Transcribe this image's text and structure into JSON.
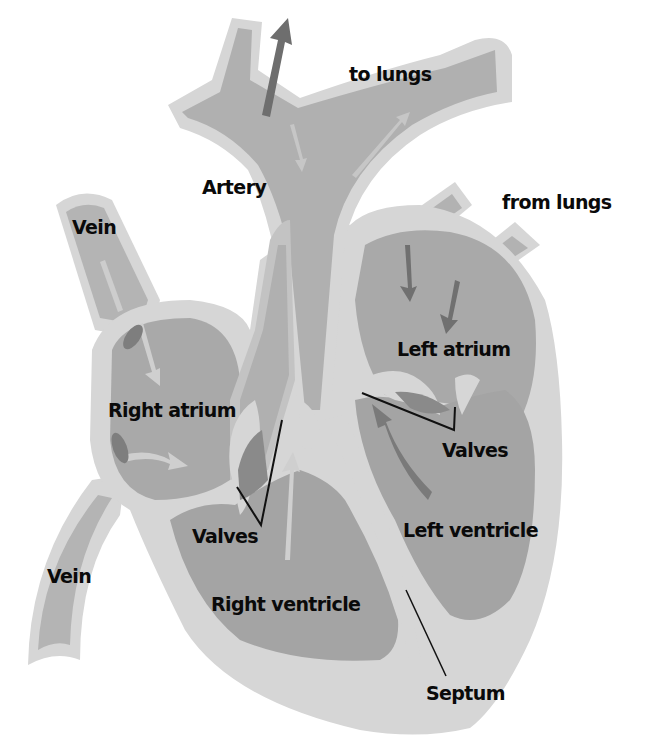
{
  "diagram": {
    "colors": {
      "background": "#ffffff",
      "wall": "#d4d4d4",
      "wall_edge": "#e6e6e6",
      "chamber": "#a8a8a8",
      "vessel_lumen": "#b2b2b2",
      "arrow_dark": "#6e6e6e",
      "arrow_light": "#cfcfcf",
      "valve_dark": "#858585",
      "text": "#0a0a0a",
      "leader_line": "#111111"
    },
    "labels": {
      "to_lungs": "to lungs",
      "artery": "Artery",
      "from_lungs": "from lungs",
      "vein_top": "Vein",
      "left_atrium": "Left atrium",
      "right_atrium": "Right atrium",
      "valves_right": "Valves",
      "valves_left": "Valves",
      "left_ventricle": "Left ventricle",
      "vein_bottom": "Vein",
      "right_ventricle": "Right ventricle",
      "septum": "Septum"
    }
  }
}
